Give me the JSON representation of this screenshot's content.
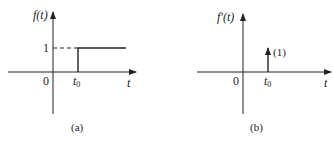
{
  "panels": [
    {
      "id": "a",
      "caption": "(a)",
      "y_label": "f(t)",
      "x_label": "t",
      "origin_label": "0",
      "t0_label": "t",
      "t0_sub": "0",
      "level_label": "1",
      "description": "unit step at t0"
    },
    {
      "id": "b",
      "caption": "(b)",
      "y_label": "f′(t)",
      "x_label": "t",
      "origin_label": "0",
      "t0_label": "t",
      "t0_sub": "0",
      "impulse_strength_label": "(1)",
      "description": "unit impulse at t0"
    }
  ],
  "colors": {
    "line": "#222222",
    "background": "#ffffff"
  }
}
